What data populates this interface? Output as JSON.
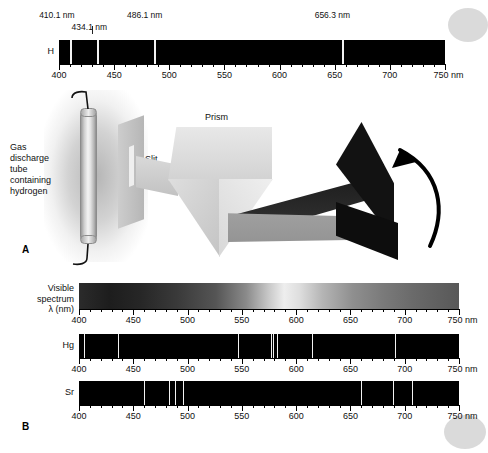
{
  "figure": {
    "panel_a_letter": "A",
    "panel_b_letter": "B",
    "unit_suffix": "nm"
  },
  "axis": {
    "ticks": [
      400,
      450,
      500,
      550,
      600,
      650,
      700,
      750
    ],
    "min": 400,
    "max": 750,
    "minor_step": 10,
    "unit": "nm"
  },
  "hydrogen_spectrum": {
    "label": "H",
    "callouts": [
      {
        "text": "410.1 nm",
        "wavelength": 410.1
      },
      {
        "text": "434.1 nm",
        "wavelength": 434.1
      },
      {
        "text": "486.1 nm",
        "wavelength": 486.1
      },
      {
        "text": "656.3 nm",
        "wavelength": 656.3
      }
    ]
  },
  "apparatus": {
    "source_label": "Gas\ndischarge\ntube\ncontaining\nhydrogen",
    "slit_label": "Slit",
    "prism_label": "Prism"
  },
  "visible_spectrum": {
    "label": "Visible\nspectrum\nλ (nm)"
  },
  "mercury_spectrum": {
    "label": "Hg"
  },
  "strontium_spectrum": {
    "label": "Sr"
  },
  "chart_data": {
    "type": "line",
    "xlabel": "λ (nm)",
    "ylabel": "",
    "xlim": [
      400,
      750
    ],
    "grid": false,
    "legend": "none",
    "tick_labels": [
      "400",
      "450",
      "500",
      "550",
      "600",
      "650",
      "700",
      "750 nm"
    ],
    "series": [
      {
        "name": "H",
        "label": "H",
        "kind": "emission-lines",
        "values": [
          410.1,
          434.1,
          486.1,
          656.3
        ],
        "annotations": [
          "410.1 nm",
          "434.1 nm",
          "486.1 nm",
          "656.3 nm"
        ]
      },
      {
        "name": "Visible spectrum",
        "label": "Visible\nspectrum\nλ (nm)",
        "kind": "continuous-gradient",
        "values": []
      },
      {
        "name": "Hg",
        "label": "Hg",
        "kind": "emission-lines",
        "values": [
          405,
          436,
          546,
          577,
          579,
          582,
          615,
          691
        ]
      },
      {
        "name": "Sr",
        "label": "Sr",
        "kind": "emission-lines",
        "values": [
          460,
          483,
          488,
          496,
          660,
          689,
          707
        ]
      }
    ]
  }
}
